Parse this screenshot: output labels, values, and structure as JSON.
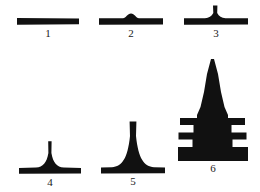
{
  "plate": {
    "title": "Comparative profile silhouettes",
    "background_color": "#ffffff",
    "ink_color": "#111111",
    "width": 260,
    "height": 192,
    "columns": 3,
    "rows": 2
  },
  "figures": [
    {
      "label": "1",
      "name": "figure-1-flat-bar",
      "description": "plain horizontal slab with no superstructure",
      "tiers": 0,
      "spire": "none",
      "relative_height": 1,
      "base_width": 62,
      "peak_height_px": 0,
      "x": 16,
      "y": 10,
      "w": 64,
      "h": 22,
      "label_y": 28
    },
    {
      "label": "2",
      "name": "figure-2-low-bump",
      "description": "horizontal slab with a small rounded boss at center",
      "tiers": 0,
      "spire": "rounded-bump",
      "relative_height": 2,
      "base_width": 64,
      "peak_height_px": 5,
      "x": 98,
      "y": 10,
      "w": 66,
      "h": 22,
      "label_y": 28
    },
    {
      "label": "3",
      "name": "figure-3-short-spike",
      "description": "horizontal slab with a short narrow spike rising from a small flared foot",
      "tiers": 0,
      "spire": "narrow-spike",
      "relative_height": 3,
      "base_width": 64,
      "peak_height_px": 12,
      "x": 182,
      "y": 4,
      "w": 68,
      "h": 28,
      "label_y": 28
    },
    {
      "label": "4",
      "name": "figure-4-tall-spike",
      "description": "horizontal slab with a tall slender spike on a concave flared base",
      "tiers": 0,
      "spire": "tall-spike",
      "relative_height": 4,
      "base_width": 62,
      "peak_height_px": 27,
      "x": 18,
      "y": 140,
      "w": 64,
      "h": 36,
      "label_y": 177
    },
    {
      "label": "5",
      "name": "figure-5-tall-spire",
      "description": "tall flat-topped spire on a broad concave splayed base over a horizontal slab",
      "tiers": 0,
      "spire": "tall-flat-top-spire",
      "relative_height": 5,
      "base_width": 64,
      "peak_height_px": 52,
      "x": 100,
      "y": 118,
      "w": 66,
      "h": 58,
      "label_y": 177
    },
    {
      "label": "6",
      "name": "figure-6-tiered-pagoda",
      "description": "large tiered tower: tall pointed spire above three stepped eave bands",
      "tiers": 3,
      "spire": "tall-pointed-spire",
      "relative_height": 6,
      "base_width": 74,
      "peak_height_px": 112,
      "x": 174,
      "y": 58,
      "w": 78,
      "h": 118,
      "label_y": 177
    }
  ]
}
